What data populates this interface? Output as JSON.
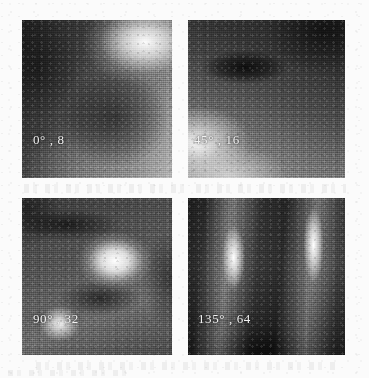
{
  "figure": {
    "kind": "gabor-filter-response-grid",
    "rows": 2,
    "columns": 2,
    "background_color": "#fbfbfb",
    "caption_color": "#f2f2f2",
    "panels": [
      {
        "id": "panel-0",
        "orientation": "0°",
        "scale": "8",
        "caption": "0° , 8",
        "description": "dark field with a bright blob in the upper-right corner"
      },
      {
        "id": "panel-1",
        "orientation": "45°",
        "scale": "16",
        "caption": "45° , 16",
        "description": "dark upper band, brightening toward the lower-left corner"
      },
      {
        "id": "panel-2",
        "orientation": "90°",
        "scale": "32",
        "caption": "90° , 32",
        "description": "large bright blob centre-right and a smaller bright blob lower-left separated by dark diagonal bands"
      },
      {
        "id": "panel-3",
        "orientation": "135°",
        "scale": "64",
        "caption": "135° , 64",
        "description": "two bright near-vertical stripes on a dark field"
      }
    ]
  }
}
